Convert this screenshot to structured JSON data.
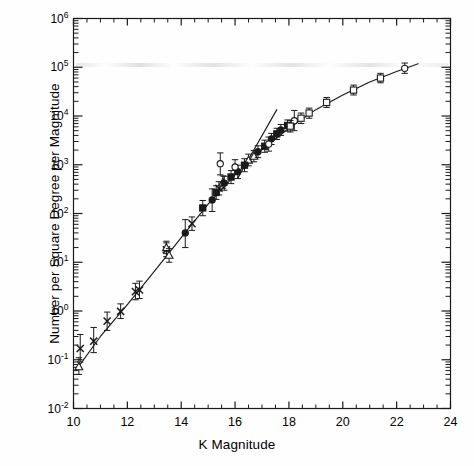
{
  "figure": {
    "background_color": "#fefefe",
    "ink_color": "#1a1a1a"
  },
  "chart_data": {
    "type": "scatter",
    "title": "",
    "xlabel": "K Magnitude",
    "ylabel": "Number per Square Degree per Magnitude",
    "xlim": [
      10,
      24
    ],
    "ylim_log10": [
      -2,
      6
    ],
    "yscale": "log",
    "xscale": "linear",
    "grid": false,
    "legend": "none",
    "x_ticks_major": [
      10,
      12,
      14,
      16,
      18,
      20,
      22,
      24
    ],
    "x_tick_labels": [
      "10",
      "12",
      "14",
      "16",
      "18",
      "20",
      "22",
      "24"
    ],
    "x_minor_interval": 0.5,
    "y_ticks_major_log10": [
      -2,
      -1,
      0,
      1,
      2,
      3,
      4,
      5,
      6
    ],
    "y_tick_labels": [
      "10-2",
      "10-1",
      "100",
      "101",
      "102",
      "103",
      "104",
      "105",
      "106"
    ],
    "y_tick_mantissas": [
      "10",
      "10",
      "10",
      "10",
      "10",
      "10",
      "10",
      "10",
      "10"
    ],
    "y_tick_exponents": [
      "-2",
      "-1",
      "0",
      "1",
      "2",
      "3",
      "4",
      "5",
      "6"
    ],
    "series": [
      {
        "name": "bright-counts-cross",
        "marker": "cross",
        "fill": "none",
        "points": [
          {
            "x": 10.25,
            "y": 0.17,
            "yerr_lo": 0.09,
            "yerr_hi": 0.33
          },
          {
            "x": 10.75,
            "y": 0.24,
            "yerr_lo": 0.14,
            "yerr_hi": 0.46
          },
          {
            "x": 11.25,
            "y": 0.62,
            "yerr_lo": 0.4,
            "yerr_hi": 0.95
          },
          {
            "x": 11.75,
            "y": 0.98,
            "yerr_lo": 0.7,
            "yerr_hi": 1.4
          },
          {
            "x": 12.3,
            "y": 2.5,
            "yerr_lo": 1.7,
            "yerr_hi": 3.7
          },
          {
            "x": 12.45,
            "y": 2.7,
            "yerr_lo": 1.8,
            "yerr_hi": 4.1
          },
          {
            "x": 13.45,
            "y": 18.0,
            "yerr_lo": 13.0,
            "yerr_hi": 25.0
          },
          {
            "x": 14.4,
            "y": 62.0,
            "yerr_lo": 45.0,
            "yerr_hi": 85.0
          },
          {
            "x": 15.4,
            "y": 330.0,
            "yerr_lo": 240.0,
            "yerr_hi": 450.0
          }
        ]
      },
      {
        "name": "bright-counts-triangle",
        "marker": "triangle",
        "fill": "none",
        "points": [
          {
            "x": 10.2,
            "y": 0.072,
            "yerr_lo": 0.05,
            "yerr_hi": 0.11
          },
          {
            "x": 13.45,
            "y": 20.0,
            "yerr_lo": 15.0,
            "yerr_hi": 27.0
          },
          {
            "x": 13.55,
            "y": 14.0,
            "yerr_lo": 10.0,
            "yerr_hi": 19.0
          },
          {
            "x": 15.55,
            "y": 440.0,
            "yerr_lo": 330.0,
            "yerr_hi": 590.0
          },
          {
            "x": 16.5,
            "y": 1250.0,
            "yerr_lo": 950.0,
            "yerr_hi": 1650.0
          },
          {
            "x": 16.7,
            "y": 1500.0,
            "yerr_lo": 1150.0,
            "yerr_hi": 1950.0
          }
        ]
      },
      {
        "name": "intermediate-counts-filled-circle",
        "marker": "circle",
        "fill": "solid",
        "points": [
          {
            "x": 14.15,
            "y": 40.0,
            "yerr_lo": 20.0,
            "yerr_hi": 75.0
          },
          {
            "x": 15.15,
            "y": 190.0,
            "yerr_lo": 110.0,
            "yerr_hi": 320.0
          },
          {
            "x": 15.6,
            "y": 420.0,
            "yerr_lo": 300.0,
            "yerr_hi": 580.0
          },
          {
            "x": 16.1,
            "y": 720.0,
            "yerr_lo": 520.0,
            "yerr_hi": 980.0
          },
          {
            "x": 16.85,
            "y": 1850.0,
            "yerr_lo": 1400.0,
            "yerr_hi": 2450.0
          },
          {
            "x": 17.35,
            "y": 3400.0,
            "yerr_lo": 2600.0,
            "yerr_hi": 4400.0
          },
          {
            "x": 17.7,
            "y": 5200.0,
            "yerr_lo": 4000.0,
            "yerr_hi": 6700.0
          }
        ]
      },
      {
        "name": "deep-counts-filled-square",
        "marker": "square",
        "fill": "solid",
        "points": [
          {
            "x": 14.8,
            "y": 130.0,
            "yerr_lo": 90.0,
            "yerr_hi": 185.0
          },
          {
            "x": 15.3,
            "y": 270.0,
            "yerr_lo": 195.0,
            "yerr_hi": 370.0
          },
          {
            "x": 15.85,
            "y": 560.0,
            "yerr_lo": 410.0,
            "yerr_hi": 760.0
          },
          {
            "x": 16.35,
            "y": 980.0,
            "yerr_lo": 720.0,
            "yerr_hi": 1330.0
          },
          {
            "x": 17.1,
            "y": 2400.0,
            "yerr_lo": 1800.0,
            "yerr_hi": 3200.0
          },
          {
            "x": 17.55,
            "y": 4300.0,
            "yerr_lo": 3300.0,
            "yerr_hi": 5600.0
          },
          {
            "x": 17.95,
            "y": 6400.0,
            "yerr_lo": 4900.0,
            "yerr_hi": 8300.0
          }
        ]
      },
      {
        "name": "faint-counts-open-circle",
        "marker": "circle",
        "fill": "open",
        "points": [
          {
            "x": 15.45,
            "y": 1050.0,
            "yerr_lo": 620.0,
            "yerr_hi": 1750.0
          },
          {
            "x": 16.0,
            "y": 900.0,
            "yerr_lo": 640.0,
            "yerr_hi": 1270.0
          },
          {
            "x": 17.25,
            "y": 2650.0,
            "yerr_lo": 1900.0,
            "yerr_hi": 3700.0
          },
          {
            "x": 18.2,
            "y": 8000.0,
            "yerr_lo": 5000.0,
            "yerr_hi": 13000.0
          },
          {
            "x": 22.3,
            "y": 95000.0,
            "yerr_lo": 75000.0,
            "yerr_hi": 122000.0
          }
        ]
      },
      {
        "name": "faint-counts-open-square",
        "marker": "square",
        "fill": "open",
        "points": [
          {
            "x": 18.05,
            "y": 6200.0,
            "yerr_lo": 4700.0,
            "yerr_hi": 8100.0
          },
          {
            "x": 18.45,
            "y": 9000.0,
            "yerr_lo": 7000.0,
            "yerr_hi": 11500.0
          },
          {
            "x": 18.75,
            "y": 11500.0,
            "yerr_lo": 9000.0,
            "yerr_hi": 14500.0
          },
          {
            "x": 19.4,
            "y": 19000.0,
            "yerr_lo": 15000.0,
            "yerr_hi": 24000.0
          },
          {
            "x": 20.4,
            "y": 34000.0,
            "yerr_lo": 27000.0,
            "yerr_hi": 43000.0
          },
          {
            "x": 21.4,
            "y": 60000.0,
            "yerr_lo": 48000.0,
            "yerr_hi": 75000.0
          }
        ]
      }
    ],
    "lines": [
      {
        "name": "model-count-curve",
        "style": "solid",
        "description": "main fitted number-count relation",
        "points": [
          {
            "x": 10.1,
            "y": 0.062
          },
          {
            "x": 11.0,
            "y": 0.3
          },
          {
            "x": 12.0,
            "y": 1.35
          },
          {
            "x": 13.0,
            "y": 6.5
          },
          {
            "x": 14.0,
            "y": 32.0
          },
          {
            "x": 15.0,
            "y": 155.0
          },
          {
            "x": 16.0,
            "y": 620.0
          },
          {
            "x": 17.0,
            "y": 2050.0
          },
          {
            "x": 18.0,
            "y": 5600.0
          },
          {
            "x": 19.0,
            "y": 13500.0
          },
          {
            "x": 20.0,
            "y": 27000.0
          },
          {
            "x": 21.0,
            "y": 50000.0
          },
          {
            "x": 22.0,
            "y": 82000.0
          },
          {
            "x": 22.8,
            "y": 118000.0
          }
        ]
      },
      {
        "name": "euclidean-slope-line",
        "style": "solid",
        "description": "steeper straight-line extrapolation diverging near K=17",
        "points": [
          {
            "x": 16.1,
            "y": 530.0
          },
          {
            "x": 17.55,
            "y": 13500.0
          }
        ]
      }
    ]
  }
}
